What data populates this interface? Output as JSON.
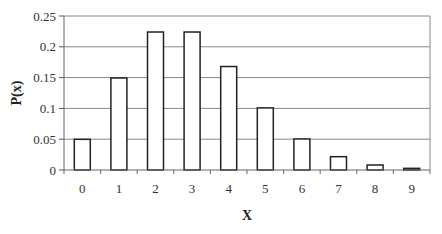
{
  "chart_data": {
    "type": "bar",
    "title": "",
    "xlabel": "X",
    "ylabel": "P(x)",
    "categories": [
      "0",
      "1",
      "2",
      "3",
      "4",
      "5",
      "6",
      "7",
      "8",
      "9"
    ],
    "values": [
      0.0498,
      0.1494,
      0.224,
      0.224,
      0.168,
      0.1008,
      0.0504,
      0.0216,
      0.0081,
      0.0027
    ],
    "ylim": [
      0,
      0.25
    ],
    "yticks": [
      "0",
      "0.05",
      "0.1",
      "0.15",
      "0.2",
      "0.25"
    ],
    "grid": true,
    "legend": null,
    "bar_fill": "#ffffff",
    "bar_stroke": "#222222",
    "grid_color": "#888888"
  }
}
